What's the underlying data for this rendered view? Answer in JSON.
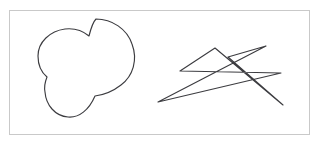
{
  "canvas": {
    "width": 321,
    "height": 146,
    "background_color": "#ffffff",
    "description": "Two hand-drawn line figures inside a thin rectangular frame"
  },
  "frame": {
    "name": "figure-frame",
    "x": 9,
    "y": 10,
    "width": 301,
    "height": 125,
    "border_color": "#c9c9c9",
    "border_width": 1,
    "fill_color": "#ffffff"
  },
  "style": {
    "stroke_color": "#3c3c40",
    "stroke_width": 1.15,
    "fill": "none"
  },
  "figures": [
    {
      "id": "trefoil-loops",
      "label": "Three overlapping loops",
      "type": "closed-curve",
      "bbox": {
        "x": 38,
        "y": 18,
        "width": 96,
        "height": 100
      },
      "path": "M 96,19 C 112,19 127,29 132,44 C 138,60 133,76 121,85 C 112,92 103,95 95,96 C 89,110 79,118 68,117 C 55,116 46,105 45,92 C 44,87 45,82 47,77 C 41,72 38,64 38,56 C 38,42 50,31 65,29 C 74,28 83,31 89,36 C 91,28 93,22 96,19 Z",
      "loops": [
        {
          "name": "upper-right-loop",
          "center": [
            97,
            48
          ],
          "rx": 28,
          "ry": 30,
          "rotation": -18
        },
        {
          "name": "left-loop",
          "center": [
            69,
            62
          ],
          "rx": 31,
          "ry": 23,
          "rotation": -8
        },
        {
          "name": "lower-loop",
          "center": [
            88,
            87
          ],
          "rx": 27,
          "ry": 30,
          "rotation": 12
        }
      ]
    },
    {
      "id": "star-polyline",
      "label": "Star-shaped zigzag polyline",
      "type": "polyline",
      "bbox": {
        "x": 158,
        "y": 45,
        "width": 127,
        "height": 61
      },
      "points": [
        [
          180,
          71
        ],
        [
          281,
          73
        ],
        [
          158,
          102
        ],
        [
          266,
          46
        ],
        [
          228,
          57
        ],
        [
          283,
          105
        ],
        [
          215,
          48
        ],
        [
          180,
          71
        ]
      ]
    }
  ]
}
